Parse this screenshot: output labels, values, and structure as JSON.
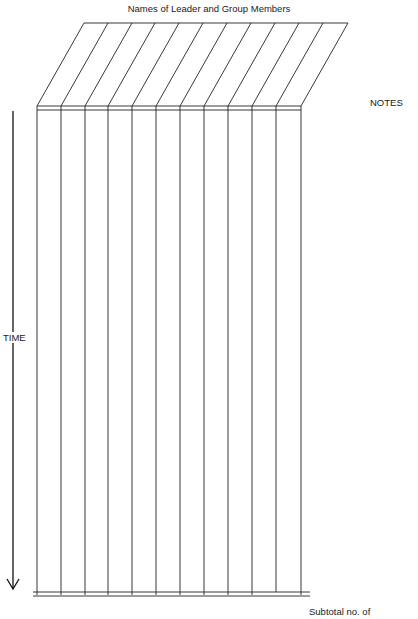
{
  "form": {
    "title": "Names of Leader and Group Members",
    "notes_label": "NOTES",
    "time_label": "TIME",
    "subtotal_label": "Subtotal no. of",
    "column_count": 11
  }
}
